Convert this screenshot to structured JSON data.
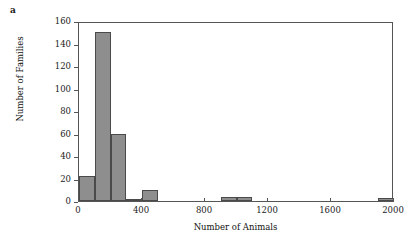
{
  "figure": {
    "panel_label": "a",
    "background_color": "#ffffff"
  },
  "chart_data": {
    "type": "bar",
    "title": "",
    "subtitle": "",
    "xlabel": "Number of Animals",
    "ylabel": "Number of Families",
    "xlim": [
      0,
      2000
    ],
    "ylim": [
      0,
      160
    ],
    "xticks": [
      0,
      400,
      800,
      1200,
      1600,
      2000
    ],
    "xtick_labels": [
      "0",
      "400",
      "800",
      "1200",
      "1600",
      "2000"
    ],
    "yticks": [
      0,
      20,
      40,
      60,
      80,
      100,
      120,
      140,
      160
    ],
    "ytick_labels": [
      "0",
      "20",
      "40",
      "60",
      "80",
      "100",
      "120",
      "140",
      "160"
    ],
    "grid": false,
    "legend": null,
    "bin_width": 100,
    "bar_color": "#8e8e8e",
    "bar_edge_color": "#4a4a4a",
    "categories": [
      "0-100",
      "100-200",
      "200-300",
      "300-400",
      "400-500",
      "500-600",
      "600-700",
      "700-800",
      "800-900",
      "900-1000",
      "1000-1100",
      "1100-1200",
      "1200-1300",
      "1300-1400",
      "1400-1500",
      "1500-1600",
      "1600-1700",
      "1700-1800",
      "1800-1900",
      "1900-2000"
    ],
    "bin_starts": [
      0,
      100,
      200,
      300,
      400,
      500,
      600,
      700,
      800,
      900,
      1000,
      1100,
      1200,
      1300,
      1400,
      1500,
      1600,
      1700,
      1800,
      1900
    ],
    "values": [
      22,
      150,
      60,
      1,
      10,
      0,
      0,
      0,
      0,
      4,
      4,
      0,
      0,
      0,
      0,
      0,
      0,
      0,
      0,
      3
    ],
    "annotations": []
  }
}
